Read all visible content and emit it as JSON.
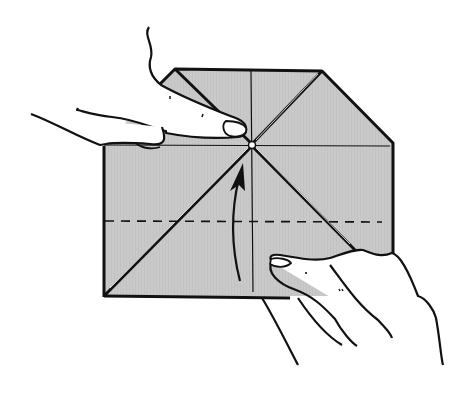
{
  "diagram": {
    "type": "origami-instruction-step",
    "description": "Hands holding a folded paper; arrow indicates folding the lower edge up along the dashed line",
    "colors": {
      "paper": "#c8c8c8",
      "ink": "#111111",
      "background": "#ffffff",
      "skin": "#ffffff"
    },
    "elements": {
      "paper": "folded-paper",
      "fold_line": "dashed-valley-fold-line",
      "arrow": "fold-up-arrow",
      "left_hand": "left-hand-holding-center",
      "right_hand": "right-hand-lifting-bottom-edge"
    }
  }
}
